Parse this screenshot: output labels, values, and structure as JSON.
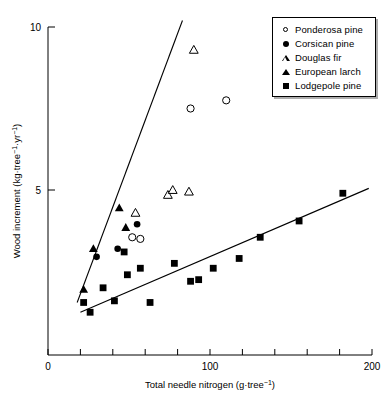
{
  "chart_data": {
    "type": "scatter",
    "title": "",
    "xlabel": "Total needle nitrogen (g·tree⁻¹)",
    "xlabel_parts": {
      "base": "Total needle nitrogen (g·tree",
      "sup": "−1",
      "tail": ")"
    },
    "ylabel": "Wood increment (kg·tree⁻¹·yr⁻¹)",
    "ylabel_parts": {
      "base": "Wood increment (kg·tree",
      "sup1": "−1",
      "mid": "·yr",
      "sup2": "−1",
      "tail": ")"
    },
    "xlim": [
      0,
      200
    ],
    "ylim": [
      0.6,
      10.4
    ],
    "xticks": [
      0,
      20,
      40,
      60,
      80,
      100,
      120,
      140,
      160,
      180,
      200
    ],
    "xtick_labels": [
      "0",
      "",
      "",
      "",
      "",
      "100",
      "",
      "",
      "",
      "",
      "200"
    ],
    "yticks": [
      5,
      10
    ],
    "ytick_labels": [
      "5",
      "10"
    ],
    "grid": false,
    "legend_position": "top-right",
    "series": [
      {
        "name": "Ponderosa pine",
        "marker": "open-circle",
        "points": [
          {
            "x": 52,
            "y": 3.55
          },
          {
            "x": 57,
            "y": 3.5
          },
          {
            "x": 88,
            "y": 7.5
          },
          {
            "x": 110,
            "y": 7.75
          }
        ]
      },
      {
        "name": "Corsican pine",
        "marker": "filled-circle",
        "points": [
          {
            "x": 30,
            "y": 2.95
          },
          {
            "x": 43,
            "y": 3.2
          },
          {
            "x": 55,
            "y": 3.95
          }
        ]
      },
      {
        "name": "Douglas fir",
        "marker": "open-triangle",
        "points": [
          {
            "x": 54,
            "y": 4.3
          },
          {
            "x": 74,
            "y": 4.85
          },
          {
            "x": 77,
            "y": 5.0
          },
          {
            "x": 87,
            "y": 4.95
          },
          {
            "x": 90,
            "y": 9.3
          }
        ]
      },
      {
        "name": "European larch",
        "marker": "filled-triangle",
        "points": [
          {
            "x": 22,
            "y": 1.95
          },
          {
            "x": 28,
            "y": 3.2
          },
          {
            "x": 44,
            "y": 4.45
          },
          {
            "x": 48,
            "y": 3.85
          }
        ]
      },
      {
        "name": "Lodgepole pine",
        "marker": "filled-square",
        "points": [
          {
            "x": 22,
            "y": 1.55
          },
          {
            "x": 26,
            "y": 1.25
          },
          {
            "x": 34,
            "y": 2.0
          },
          {
            "x": 41,
            "y": 1.6
          },
          {
            "x": 47,
            "y": 3.1
          },
          {
            "x": 49,
            "y": 2.4
          },
          {
            "x": 57,
            "y": 2.6
          },
          {
            "x": 63,
            "y": 1.55
          },
          {
            "x": 78,
            "y": 2.75
          },
          {
            "x": 88,
            "y": 2.2
          },
          {
            "x": 93,
            "y": 2.25
          },
          {
            "x": 102,
            "y": 2.6
          },
          {
            "x": 118,
            "y": 2.9
          },
          {
            "x": 131,
            "y": 3.55
          },
          {
            "x": 155,
            "y": 4.05
          },
          {
            "x": 182,
            "y": 4.9
          }
        ]
      }
    ],
    "fit_lines": [
      {
        "name": "conifer-steep-fit",
        "x1": 18,
        "y1": 1.55,
        "x2": 83,
        "y2": 10.2
      },
      {
        "name": "lodgepole-shallow-fit",
        "x1": 20,
        "y1": 1.25,
        "x2": 198,
        "y2": 5.05
      }
    ]
  },
  "legend": {
    "items": [
      {
        "label": "Ponderosa pine",
        "marker": "open-circle"
      },
      {
        "label": "Corsican pine",
        "marker": "filled-circle"
      },
      {
        "label": "Douglas fir",
        "marker": "open-triangle"
      },
      {
        "label": "European larch",
        "marker": "filled-triangle"
      },
      {
        "label": "Lodgepole pine",
        "marker": "filled-square"
      }
    ]
  },
  "colors": {
    "foreground": "#000000",
    "background": "#ffffff"
  }
}
